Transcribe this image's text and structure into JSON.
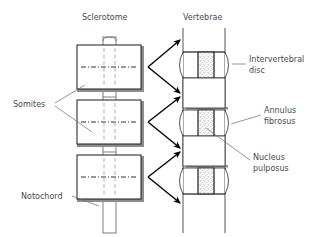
{
  "figure": {
    "background_color": "#ffffff",
    "ink_color": "#1a1a1a",
    "text_color": "#4a4a4a",
    "stipple_color": "#b9b9b9",
    "shadow_color": "#8d8d8d"
  },
  "headings": {
    "left": "Sclerotome",
    "right": "Vertebrae"
  },
  "labels": {
    "somites": "Somites",
    "notochord": "Notochord",
    "intervertebral_disc_line1": "Intervertebral",
    "intervertebral_disc_line2": "disc",
    "annulus_line1": "Annulus",
    "annulus_line2": "fibrosus",
    "nucleus_line1": "Nucleus",
    "nucleus_line2": "pulposus"
  },
  "left_column": {
    "name": "sclerotome-somite-stack",
    "somite_count": 3,
    "somites": [
      {
        "id": "somite-upper",
        "label": "Somite (upper)"
      },
      {
        "id": "somite-middle",
        "label": "Somite (middle)"
      },
      {
        "id": "somite-lower",
        "label": "Somite (lower)"
      }
    ],
    "notochord": {
      "id": "notochord-column",
      "label": "Notochord"
    }
  },
  "right_column": {
    "name": "vertebral-column",
    "vertebra_count": 3,
    "vertebrae": [
      {
        "id": "vertebra-upper",
        "label": "Vertebra (upper)"
      },
      {
        "id": "vertebra-middle",
        "label": "Vertebra (middle)"
      },
      {
        "id": "vertebra-lower",
        "label": "Vertebra (lower)"
      }
    ],
    "disc_count": 3,
    "discs": [
      {
        "id": "disc-upper",
        "label": "Intervertebral disc (upper)"
      },
      {
        "id": "disc-middle",
        "label": "Intervertebral disc (middle)"
      },
      {
        "id": "disc-lower",
        "label": "Intervertebral disc (lower)"
      }
    ]
  },
  "arrows": {
    "name": "transformation-arrows",
    "count": 6,
    "description": "Arrows mapping somite halves to developing vertebrae"
  }
}
